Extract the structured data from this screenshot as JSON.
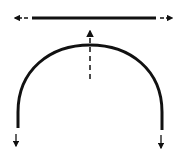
{
  "diagram": {
    "colors": {
      "stroke": "#111111",
      "background": "#ffffff"
    },
    "beam": {
      "x1": 32,
      "y1": 18,
      "x2": 156,
      "y2": 18,
      "stroke_width": 3
    },
    "forces": [
      {
        "name": "beam-left-force",
        "direction": "left",
        "x1": 28,
        "y1": 18,
        "x2": 14,
        "y2": 18,
        "dashed": true
      },
      {
        "name": "beam-right-force",
        "direction": "right",
        "x1": 160,
        "y1": 18,
        "x2": 173,
        "y2": 18,
        "dashed": true
      },
      {
        "name": "crown-up-force",
        "direction": "up",
        "x1": 90,
        "y1": 79,
        "x2": 90,
        "y2": 30,
        "dashed": true
      },
      {
        "name": "left-foot-down-force",
        "direction": "down",
        "x1": 16,
        "y1": 134,
        "x2": 16,
        "y2": 146,
        "dashed": false
      },
      {
        "name": "right-foot-down-force",
        "direction": "down",
        "x1": 161,
        "y1": 135,
        "x2": 161,
        "y2": 148,
        "dashed": false
      }
    ],
    "arch": {
      "left_x": 18,
      "left_bottom_y": 128,
      "right_x": 162,
      "right_bottom_y": 130,
      "crown_x": 90,
      "crown_y": 45,
      "stroke_width": 3
    }
  }
}
